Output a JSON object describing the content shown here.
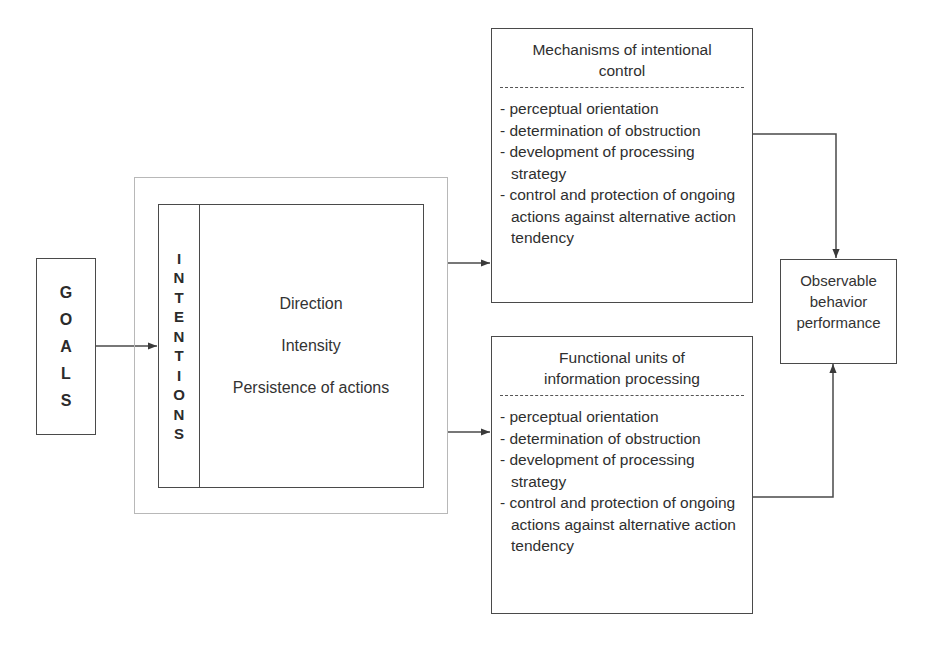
{
  "diagram": {
    "goals": {
      "letters": [
        "G",
        "O",
        "A",
        "L",
        "S"
      ],
      "label": "GOALS"
    },
    "intentions": {
      "letters": [
        "I",
        "N",
        "T",
        "E",
        "N",
        "T",
        "I",
        "O",
        "N",
        "S"
      ],
      "label": "INTENTIONS",
      "attributes": [
        "Direction",
        "Intensity",
        "Persistence of actions"
      ]
    },
    "mechanisms": {
      "title": "Mechanisms of intentional control",
      "title_lines": [
        "Mechanisms of intentional",
        "control"
      ],
      "items": [
        "- perceptual orientation",
        "- determination of obstruction",
        "- development of processing strategy",
        "- control and protection of ongoing actions against alternative action tendency"
      ]
    },
    "functional_units": {
      "title": "Functional units of information processing",
      "title_lines": [
        "Functional units of",
        "information processing"
      ],
      "items": [
        "- perceptual orientation",
        "- determination of obstruction",
        "- development of processing strategy",
        "- control and protection of ongoing actions against alternative action tendency"
      ]
    },
    "outcome": {
      "title": "Observable behavior performance",
      "title_lines": [
        "Observable",
        "behavior",
        "performance"
      ]
    },
    "edges": [
      {
        "from": "GOALS",
        "to": "INTENTIONS"
      },
      {
        "from": "INTENTIONS",
        "to": "Mechanisms of intentional control"
      },
      {
        "from": "INTENTIONS",
        "to": "Functional units of information processing"
      },
      {
        "from": "Mechanisms of intentional control",
        "to": "Observable behavior performance"
      },
      {
        "from": "Functional units of information processing",
        "to": "Observable behavior performance"
      }
    ],
    "colors": {
      "line": "#4a4a4a",
      "outer_frame": "#b8b8b8",
      "text": "#2b2b2b",
      "background": "#ffffff"
    }
  }
}
